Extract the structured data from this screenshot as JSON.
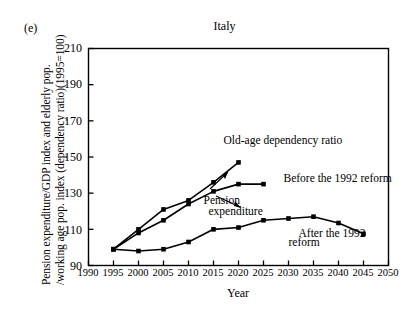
{
  "figure": {
    "panel_label": "(e)",
    "title": "Italy"
  },
  "chart_data": {
    "type": "line",
    "title": "Italy",
    "xlabel": "Year",
    "ylabel_line1": "Pension expenditure/GDP index and elderly pop.",
    "ylabel_line2": "/working age pop. index (dependency ratio)(1995=100)",
    "xlim": [
      1990,
      2050
    ],
    "ylim": [
      90,
      210
    ],
    "xticks": [
      1990,
      1995,
      2000,
      2005,
      2010,
      2015,
      2020,
      2025,
      2030,
      2035,
      2040,
      2045,
      2050
    ],
    "yticks": [
      90,
      110,
      130,
      150,
      170,
      190,
      210
    ],
    "grid": false,
    "legend": "annotations-inline",
    "marker": "filled-square",
    "series": [
      {
        "name": "Old-age dependency ratio",
        "x": [
          1995,
          2000,
          2005,
          2010,
          2015,
          2020
        ],
        "values": [
          99,
          110,
          121,
          126,
          136,
          147
        ]
      },
      {
        "name": "Before the 1992 reform",
        "x": [
          1995,
          2000,
          2005,
          2010,
          2015,
          2020,
          2025
        ],
        "values": [
          99,
          108,
          115,
          124,
          131,
          135,
          135
        ]
      },
      {
        "name": "After the 1992 reform",
        "x": [
          1995,
          2000,
          2005,
          2010,
          2015,
          2020,
          2025,
          2030,
          2035,
          2040,
          2045
        ],
        "values": [
          99,
          98,
          99,
          103,
          110,
          111,
          115,
          116,
          117,
          113.5,
          107.5
        ]
      }
    ],
    "annotations": [
      {
        "text": "Old-age dependency ratio",
        "x": 2017,
        "y": 157
      },
      {
        "text": "Before the 1992 reform",
        "x": 2029,
        "y": 136
      },
      {
        "text": "Pension",
        "x": 2013,
        "y": 124
      },
      {
        "text": "expenditure",
        "x": 2014,
        "y": 118
      },
      {
        "text": "After the 1992",
        "x": 2032,
        "y": 106
      },
      {
        "text": "reform",
        "x": 2030,
        "y": 101
      }
    ]
  }
}
